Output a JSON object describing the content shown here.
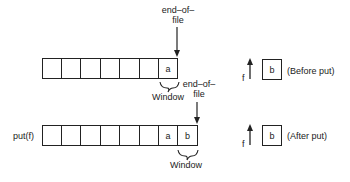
{
  "diagram": {
    "before": {
      "eof_label_line1": "end–of–",
      "eof_label_line2": "file",
      "cells": [
        "",
        "",
        "",
        "",
        "",
        "",
        "a"
      ],
      "window_label": "Window",
      "pointer_label": "f",
      "buffer_value": "b",
      "state_label": "(Before put)"
    },
    "after": {
      "operation_label": "put(f)",
      "eof_label_line1": "end–of–",
      "eof_label_line2": "file",
      "cells": [
        "",
        "",
        "",
        "",
        "",
        "",
        "a",
        "b"
      ],
      "window_label": "Window",
      "pointer_label": "f",
      "buffer_value": "b",
      "state_label": "(After put)"
    }
  }
}
